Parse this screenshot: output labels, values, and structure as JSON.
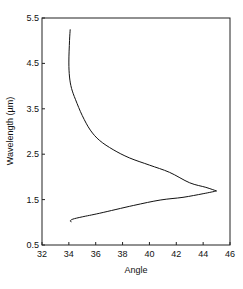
{
  "chart_data": {
    "type": "line",
    "title": "",
    "xlabel": "Angle",
    "ylabel": "Wavelength (µm)",
    "xlim": [
      32,
      46
    ],
    "ylim": [
      0.5,
      5.5
    ],
    "xticks": [
      32,
      34,
      36,
      38,
      40,
      42,
      44,
      46
    ],
    "yticks": [
      0.5,
      1.5,
      2.5,
      3.5,
      4.5,
      5.5
    ],
    "xtick_labels": [
      "32",
      "34",
      "36",
      "38",
      "40",
      "42",
      "44",
      "46"
    ],
    "ytick_labels": [
      "0.5",
      "1.5",
      "2.5",
      "3.5",
      "4.5",
      "5.5"
    ],
    "grid": false,
    "legend": null,
    "series": [
      {
        "name": "curve",
        "color": "#111111",
        "x": [
          34.1,
          34.05,
          34.0,
          34.05,
          34.2,
          34.5,
          35.0,
          35.6,
          36.3,
          37.3,
          38.5,
          40.0,
          41.5,
          43.0,
          44.2,
          45.0,
          44.0,
          42.5,
          40.8,
          38.8,
          36.3,
          35.0,
          34.3,
          34.1,
          34.2
        ],
        "y": [
          5.25,
          5.0,
          4.53,
          4.2,
          3.95,
          3.7,
          3.35,
          3.03,
          2.8,
          2.6,
          2.42,
          2.26,
          2.1,
          1.87,
          1.77,
          1.69,
          1.63,
          1.55,
          1.49,
          1.37,
          1.2,
          1.12,
          1.07,
          1.03,
          1.01
        ]
      }
    ]
  }
}
